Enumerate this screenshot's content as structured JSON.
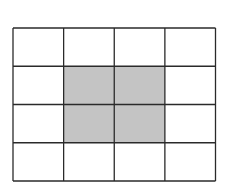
{
  "diagram": {
    "type": "grid",
    "rows": 4,
    "columns": 4,
    "shaded_cells": [
      [
        1,
        1
      ],
      [
        1,
        2
      ],
      [
        2,
        1
      ],
      [
        2,
        2
      ]
    ],
    "colors": {
      "background": "#ffffff",
      "line": "#2a2a2a",
      "shade": "#c4c4c4"
    }
  }
}
